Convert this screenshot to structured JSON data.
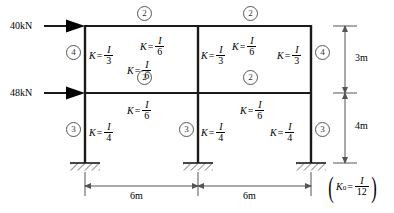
{
  "diagram": {
    "loads": [
      {
        "name": "top-lateral-load",
        "label": "40kN",
        "level": "roof"
      },
      {
        "name": "mid-lateral-load",
        "label": "48kN",
        "level": "second-floor"
      }
    ],
    "members": {
      "top_left_column": {
        "lhs": "K",
        "eq": "=",
        "num": "I",
        "den": "3"
      },
      "top_mid_column": {
        "lhs": "K",
        "eq": "=",
        "num": "I",
        "den": "6"
      },
      "top_right_column": {
        "lhs": "K",
        "eq": "=",
        "num": "I",
        "den": "3"
      },
      "mid_left_beam": {
        "lhs": "K",
        "eq": "=",
        "num": "I",
        "den": "6"
      },
      "mid_right_beam": {
        "lhs": "K",
        "eq": "=",
        "num": "I",
        "den": "6"
      },
      "bot_left_column": {
        "lhs": "K",
        "eq": "=",
        "num": "I",
        "den": "4"
      },
      "bot_mid_column": {
        "lhs": "K",
        "eq": "=",
        "num": "I",
        "den": "4"
      },
      "bot_right_column": {
        "lhs": "K",
        "eq": "=",
        "num": "I",
        "den": "4"
      }
    },
    "node_markers": {
      "top_beam_left": "2",
      "top_beam_right": "2",
      "mid_beam_left": "2",
      "mid_beam_right": "2",
      "upper_left": "4",
      "upper_right": "4",
      "lower_left": "3",
      "lower_mid": "3",
      "lower_right": "3"
    },
    "dimensions": {
      "span_left": "6m",
      "span_right": "6m",
      "height_upper": "3m",
      "height_lower": "4m"
    },
    "note": {
      "lhs": "K",
      "sub": "0",
      "eq": "=",
      "num": "I",
      "den": "12"
    },
    "colors": {
      "member": "#1a1a1a",
      "dimension": "#555555",
      "marker": "#444444"
    }
  }
}
